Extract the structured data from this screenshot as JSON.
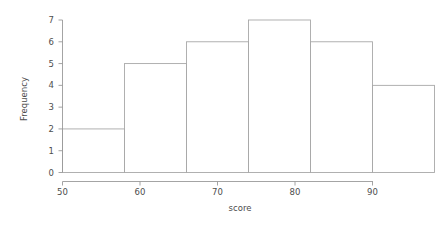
{
  "figure": {
    "background": "#ffffff",
    "line_color": "#a8a8a8",
    "text_color": "#4d4d4d"
  },
  "axes": {
    "x_title": "score",
    "y_title": "Frequency",
    "x_ticks": [
      "50",
      "60",
      "70",
      "80",
      "90"
    ],
    "y_ticks": [
      "0",
      "1",
      "2",
      "3",
      "4",
      "5",
      "6",
      "7"
    ]
  },
  "chart_data": {
    "type": "bar",
    "title": "",
    "subtitle": "",
    "xlabel": "score",
    "ylabel": "Frequency",
    "xlim": [
      50,
      98
    ],
    "ylim": [
      0,
      7
    ],
    "grid": false,
    "legend": null,
    "bin_width": 8,
    "bin_edges": [
      50,
      58,
      66,
      74,
      82,
      90,
      98
    ],
    "categories": [
      "50-58",
      "58-66",
      "66-74",
      "74-82",
      "82-90",
      "90-98"
    ],
    "values": [
      2,
      5,
      6,
      7,
      6,
      4
    ],
    "xticks": [
      50,
      60,
      70,
      80,
      90
    ],
    "yticks": [
      0,
      1,
      2,
      3,
      4,
      5,
      6,
      7
    ],
    "xtick_labels": [
      "50",
      "60",
      "70",
      "80",
      "90"
    ],
    "ytick_labels": [
      "0",
      "1",
      "2",
      "3",
      "4",
      "5",
      "6",
      "7"
    ],
    "bars": [
      {
        "x0": 50,
        "x1": 58,
        "height": 2
      },
      {
        "x0": 58,
        "x1": 66,
        "height": 5
      },
      {
        "x0": 66,
        "x1": 74,
        "height": 6
      },
      {
        "x0": 74,
        "x1": 82,
        "height": 7
      },
      {
        "x0": 82,
        "x1": 90,
        "height": 6
      },
      {
        "x0": 90,
        "x1": 98,
        "height": 4
      }
    ],
    "total_count": 30
  }
}
